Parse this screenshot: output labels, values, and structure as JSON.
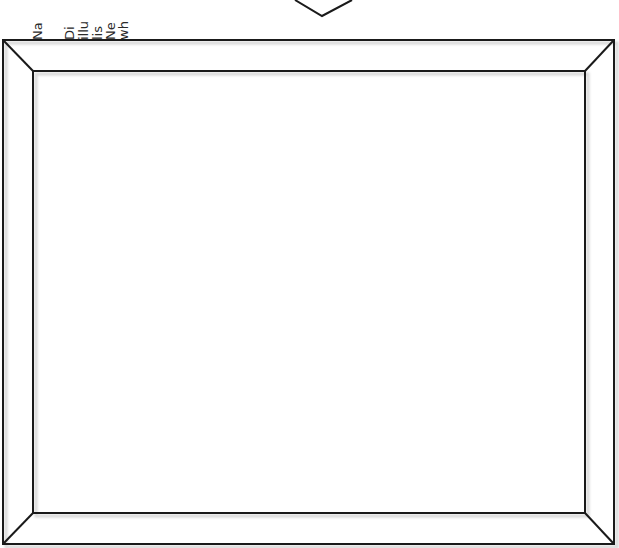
{
  "caption": {
    "lines": [
      {
        "text": "Na",
        "x": 31
      },
      {
        "text": "Di",
        "x": 63
      },
      {
        "text": "illu",
        "x": 77
      },
      {
        "text": "lis",
        "x": 91
      },
      {
        "text": "Ne",
        "x": 104
      },
      {
        "text": "wh",
        "x": 117
      }
    ]
  },
  "diagram": {
    "type": "picture-frame",
    "stroke": "#1a1a1a",
    "outer": {
      "x1": 3,
      "y1": 40,
      "x2": 614,
      "y2": 544
    },
    "inner": {
      "x1": 33,
      "y1": 71,
      "x2": 585,
      "y2": 513
    },
    "chevron": {
      "points": "295,0 322,16 352,0"
    }
  }
}
